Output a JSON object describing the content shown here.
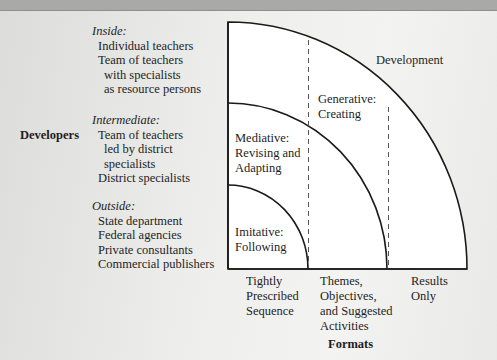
{
  "axis_labels": {
    "developers": "Developers",
    "formats": "Formats"
  },
  "developer_groups": [
    {
      "heading": "Inside:",
      "items": [
        {
          "text": "Individual teachers",
          "indent": 0
        },
        {
          "text": "Team of teachers",
          "indent": 0
        },
        {
          "text": "with specialists",
          "indent": 1
        },
        {
          "text": "as resource persons",
          "indent": 1
        }
      ]
    },
    {
      "heading": "Intermediate:",
      "items": [
        {
          "text": "Team of teachers",
          "indent": 0
        },
        {
          "text": "led by district",
          "indent": 1
        },
        {
          "text": "specialists",
          "indent": 1
        },
        {
          "text": "District specialists",
          "indent": 0
        }
      ]
    },
    {
      "heading": "Outside:",
      "items": [
        {
          "text": "State department",
          "indent": 0
        },
        {
          "text": "Federal agencies",
          "indent": 0
        },
        {
          "text": "Private consultants",
          "indent": 0
        },
        {
          "text": "Commercial publishers",
          "indent": 0
        }
      ]
    }
  ],
  "zones": {
    "development": "Development",
    "generative": [
      "Generative:",
      "Creating"
    ],
    "mediative": [
      "Mediative:",
      "Revising and",
      "Adapting"
    ],
    "imitative": [
      "Imitative:",
      "Following"
    ]
  },
  "formats": [
    [
      "Tightly",
      "Prescribed",
      "Sequence"
    ],
    [
      "Themes,",
      "Objectives,",
      "and Suggested",
      "Activities"
    ],
    [
      "Results",
      "Only"
    ]
  ],
  "colors": {
    "line": "#1a1a1a",
    "dashed": "#555555",
    "fill": "#ffffff"
  }
}
